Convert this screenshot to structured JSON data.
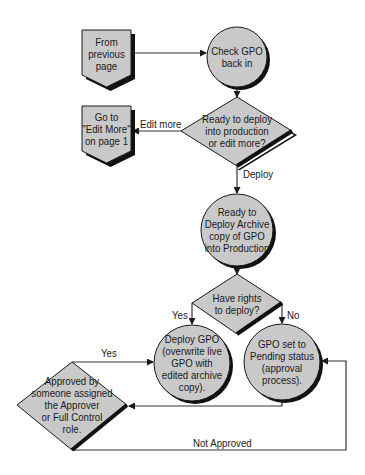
{
  "colors": {
    "fill": "#c9c9c9",
    "stroke": "#1a1a1a",
    "shadow": "#111111",
    "line": "#333333"
  },
  "nodes": {
    "from_previous": {
      "type": "off-page-connector",
      "text": "From\nprevious\npage"
    },
    "check_in": {
      "type": "process-circle",
      "text": "Check GPO\nback in"
    },
    "ready_decision": {
      "type": "decision",
      "text": "Ready to deploy\ninto production\nor edit more?"
    },
    "go_to_edit": {
      "type": "off-page-connector",
      "text": "Go to\n\"Edit More\"\non page 1"
    },
    "ready_archive": {
      "type": "process-circle",
      "text": "Ready to\nDeploy Archive\ncopy of GPO\ninto Production"
    },
    "rights_decision": {
      "type": "decision",
      "text": "Have rights\nto deploy?"
    },
    "deploy_gpo": {
      "type": "process-circle",
      "text": "Deploy GPO\n(overwrite live\nGPO with\nedited archive\ncopy)."
    },
    "pending": {
      "type": "process-circle",
      "text": "GPO set to\nPending status\n(approval\nprocess)."
    },
    "approved_decision": {
      "type": "decision",
      "text": "Approved by\nsomeone assigned\nthe Approver\nor Full Control\nrole."
    }
  },
  "edges": {
    "edit_more": "Edit more",
    "deploy": "Deploy",
    "rights_yes": "Yes",
    "rights_no": "No",
    "approved_yes": "Yes",
    "not_approved": "Not Approved"
  }
}
